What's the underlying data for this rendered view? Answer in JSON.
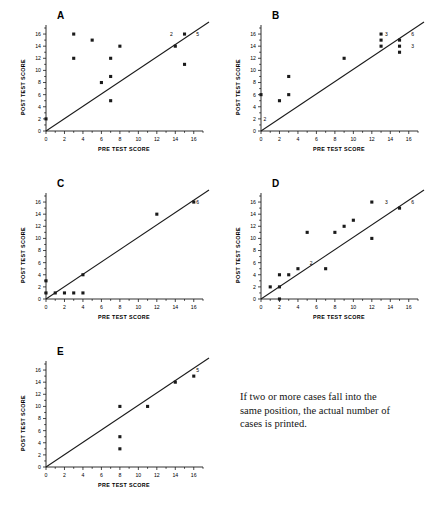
{
  "figure": {
    "caption": "If two or more cases fall into the same position, the actual number of cases is printed.",
    "axis_x_label": "PRE TEST SCORE",
    "axis_y_label": "POST TEST SCORE",
    "marker_color": "#1a1a1a",
    "line_color": "#1a1a1a",
    "axis_color": "#1a1a1a"
  },
  "chart_data": [
    {
      "type": "scatter",
      "title": "A",
      "xlabel": "PRE TEST SCORE",
      "ylabel": "POST TEST SCORE",
      "xlim": [
        0,
        17
      ],
      "ylim": [
        0,
        17
      ],
      "xticks": [
        0,
        2,
        4,
        6,
        8,
        10,
        12,
        14,
        16
      ],
      "yticks": [
        0,
        2,
        4,
        6,
        8,
        10,
        12,
        14,
        16
      ],
      "grid": false,
      "legend": "none",
      "reference_line": {
        "type": "identity",
        "x": [
          0,
          17
        ],
        "y": [
          0,
          17
        ]
      },
      "points": [
        {
          "x": 0,
          "y": 2
        },
        {
          "x": 3,
          "y": 16
        },
        {
          "x": 3,
          "y": 12
        },
        {
          "x": 5,
          "y": 15
        },
        {
          "x": 6,
          "y": 8
        },
        {
          "x": 7,
          "y": 9
        },
        {
          "x": 7,
          "y": 12
        },
        {
          "x": 7,
          "y": 5
        },
        {
          "x": 8,
          "y": 14
        },
        {
          "x": 14,
          "y": 14
        },
        {
          "x": 15,
          "y": 16
        },
        {
          "x": 15,
          "y": 11
        }
      ],
      "annotations": [
        {
          "x": 14,
          "y": 16,
          "text": "2",
          "anchor": "right"
        },
        {
          "x": 16,
          "y": 16,
          "text": "5",
          "anchor": "left"
        }
      ]
    },
    {
      "type": "scatter",
      "title": "B",
      "xlabel": "PRE TEST SCORE",
      "ylabel": "POST TEST SCORE",
      "xlim": [
        0,
        17
      ],
      "ylim": [
        0,
        17
      ],
      "xticks": [
        0,
        2,
        4,
        6,
        8,
        10,
        12,
        14,
        16
      ],
      "yticks": [
        0,
        2,
        4,
        6,
        8,
        10,
        12,
        14,
        16
      ],
      "grid": false,
      "legend": "none",
      "reference_line": {
        "type": "identity",
        "x": [
          0,
          17
        ],
        "y": [
          0,
          17
        ]
      },
      "points": [
        {
          "x": 0,
          "y": 6
        },
        {
          "x": 2,
          "y": 5
        },
        {
          "x": 3,
          "y": 9
        },
        {
          "x": 3,
          "y": 6
        },
        {
          "x": 9,
          "y": 12
        },
        {
          "x": 13,
          "y": 16
        },
        {
          "x": 13,
          "y": 15
        },
        {
          "x": 13,
          "y": 14
        },
        {
          "x": 15,
          "y": 15
        },
        {
          "x": 15,
          "y": 14
        },
        {
          "x": 15,
          "y": 13
        }
      ],
      "annotations": [
        {
          "x": 0,
          "y": 2,
          "text": "2",
          "anchor": "left"
        },
        {
          "x": 14,
          "y": 16,
          "text": "3",
          "anchor": "right"
        },
        {
          "x": 16,
          "y": 16,
          "text": "6",
          "anchor": "left"
        },
        {
          "x": 16,
          "y": 14,
          "text": "3",
          "anchor": "left"
        }
      ]
    },
    {
      "type": "scatter",
      "title": "C",
      "xlabel": "PRE TEST SCORE",
      "ylabel": "POST TEST SCORE",
      "xlim": [
        0,
        17
      ],
      "ylim": [
        0,
        17
      ],
      "xticks": [
        0,
        2,
        4,
        6,
        8,
        10,
        12,
        14,
        16
      ],
      "yticks": [
        0,
        2,
        4,
        6,
        8,
        10,
        12,
        14,
        16
      ],
      "grid": false,
      "legend": "none",
      "reference_line": {
        "type": "identity",
        "x": [
          0,
          17
        ],
        "y": [
          0,
          17
        ]
      },
      "points": [
        {
          "x": 0,
          "y": 3
        },
        {
          "x": 0,
          "y": 1
        },
        {
          "x": 1,
          "y": 1
        },
        {
          "x": 2,
          "y": 1
        },
        {
          "x": 3,
          "y": 1
        },
        {
          "x": 4,
          "y": 1
        },
        {
          "x": 4,
          "y": 4
        },
        {
          "x": 12,
          "y": 14
        },
        {
          "x": 16,
          "y": 16
        }
      ],
      "annotations": [
        {
          "x": 16,
          "y": 16,
          "text": "6",
          "anchor": "left"
        }
      ]
    },
    {
      "type": "scatter",
      "title": "D",
      "xlabel": "PRE TEST SCORE",
      "ylabel": "POST TEST SCORE",
      "xlim": [
        0,
        17
      ],
      "ylim": [
        0,
        17
      ],
      "xticks": [
        0,
        2,
        4,
        6,
        8,
        10,
        12,
        14,
        16
      ],
      "yticks": [
        0,
        2,
        4,
        6,
        8,
        10,
        12,
        14,
        16
      ],
      "grid": false,
      "legend": "none",
      "reference_line": {
        "type": "identity",
        "x": [
          0,
          17
        ],
        "y": [
          0,
          17
        ]
      },
      "points": [
        {
          "x": 1,
          "y": 2
        },
        {
          "x": 2,
          "y": 2
        },
        {
          "x": 2,
          "y": 4
        },
        {
          "x": 2,
          "y": 0
        },
        {
          "x": 3,
          "y": 4
        },
        {
          "x": 4,
          "y": 5
        },
        {
          "x": 5,
          "y": 11
        },
        {
          "x": 7,
          "y": 5
        },
        {
          "x": 8,
          "y": 11
        },
        {
          "x": 9,
          "y": 12
        },
        {
          "x": 10,
          "y": 13
        },
        {
          "x": 12,
          "y": 16
        },
        {
          "x": 12,
          "y": 10
        },
        {
          "x": 15,
          "y": 15
        }
      ],
      "annotations": [
        {
          "x": 5,
          "y": 6,
          "text": "2",
          "anchor": "left"
        },
        {
          "x": 14,
          "y": 16,
          "text": "3",
          "anchor": "right"
        },
        {
          "x": 16,
          "y": 16,
          "text": "6",
          "anchor": "left"
        }
      ]
    },
    {
      "type": "scatter",
      "title": "E",
      "xlabel": "PRE TEST SCORE",
      "ylabel": "POST TEST SCORE",
      "xlim": [
        0,
        17
      ],
      "ylim": [
        0,
        17
      ],
      "xticks": [
        0,
        2,
        4,
        6,
        8,
        10,
        12,
        14,
        16
      ],
      "yticks": [
        0,
        2,
        4,
        6,
        8,
        10,
        12,
        14,
        16
      ],
      "grid": false,
      "legend": "none",
      "reference_line": {
        "type": "identity",
        "x": [
          0,
          17
        ],
        "y": [
          0,
          17
        ]
      },
      "points": [
        {
          "x": 8,
          "y": 10
        },
        {
          "x": 8,
          "y": 5
        },
        {
          "x": 8,
          "y": 3
        },
        {
          "x": 11,
          "y": 10
        },
        {
          "x": 14,
          "y": 14
        },
        {
          "x": 16,
          "y": 15
        }
      ],
      "annotations": [
        {
          "x": 16,
          "y": 16,
          "text": "5",
          "anchor": "left"
        }
      ]
    }
  ]
}
